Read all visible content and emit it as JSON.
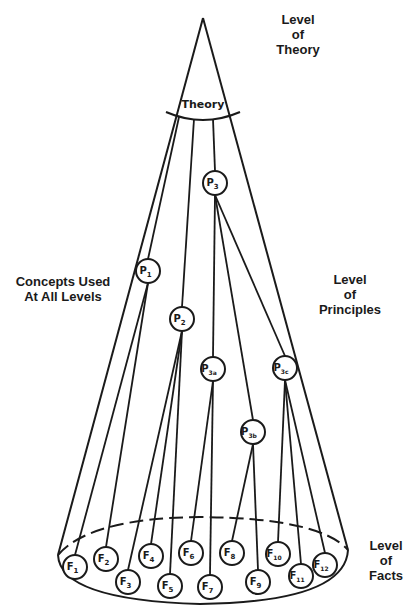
{
  "labels": {
    "theory_level": [
      "Level",
      "of",
      "Theory"
    ],
    "concepts": [
      "Concepts Used",
      "At All Levels"
    ],
    "principles_level": [
      "Level",
      "of",
      "Principles"
    ],
    "facts_level": [
      "Level",
      "of",
      "Facts"
    ]
  },
  "theory_node": {
    "label": "Theory"
  },
  "principles": [
    {
      "id": "P1",
      "main": "P",
      "sub": "1",
      "x": 148,
      "y": 271
    },
    {
      "id": "P2",
      "main": "P",
      "sub": "2",
      "x": 182,
      "y": 319
    },
    {
      "id": "P3",
      "main": "P",
      "sub": "3",
      "x": 215,
      "y": 183
    },
    {
      "id": "P3a",
      "main": "P",
      "sub": "3a",
      "x": 213,
      "y": 369
    },
    {
      "id": "P3b",
      "main": "P",
      "sub": "3b",
      "x": 253,
      "y": 432
    },
    {
      "id": "P3c",
      "main": "P",
      "sub": "3c",
      "x": 285,
      "y": 368
    }
  ],
  "facts": [
    {
      "id": "F1",
      "main": "F",
      "sub": "1",
      "x": 75,
      "y": 567
    },
    {
      "id": "F2",
      "main": "F",
      "sub": "2",
      "x": 106,
      "y": 559
    },
    {
      "id": "F3",
      "main": "F",
      "sub": "3",
      "x": 128,
      "y": 582
    },
    {
      "id": "F4",
      "main": "F",
      "sub": "4",
      "x": 151,
      "y": 556
    },
    {
      "id": "F5",
      "main": "F",
      "sub": "5",
      "x": 170,
      "y": 586
    },
    {
      "id": "F6",
      "main": "F",
      "sub": "6",
      "x": 191,
      "y": 553
    },
    {
      "id": "F7",
      "main": "F",
      "sub": "7",
      "x": 210,
      "y": 587
    },
    {
      "id": "F8",
      "main": "F",
      "sub": "8",
      "x": 232,
      "y": 553
    },
    {
      "id": "F9",
      "main": "F",
      "sub": "9",
      "x": 258,
      "y": 582
    },
    {
      "id": "F10",
      "main": "F",
      "sub": "10",
      "x": 278,
      "y": 554
    },
    {
      "id": "F11",
      "main": "F",
      "sub": "11",
      "x": 301,
      "y": 576
    },
    {
      "id": "F12",
      "main": "F",
      "sub": "12",
      "x": 325,
      "y": 565
    }
  ],
  "edges": [
    [
      "Theory",
      "P1"
    ],
    [
      "Theory",
      "P2"
    ],
    [
      "Theory",
      "P3"
    ],
    [
      "P1",
      "F1"
    ],
    [
      "P1",
      "F2"
    ],
    [
      "P2",
      "F3"
    ],
    [
      "P2",
      "F4"
    ],
    [
      "P2",
      "F5"
    ],
    [
      "P3",
      "P3a"
    ],
    [
      "P3",
      "P3b"
    ],
    [
      "P3",
      "P3c"
    ],
    [
      "P3a",
      "F6"
    ],
    [
      "P3a",
      "F7"
    ],
    [
      "P3b",
      "F8"
    ],
    [
      "P3b",
      "F9"
    ],
    [
      "P3c",
      "F10"
    ],
    [
      "P3c",
      "F11"
    ],
    [
      "P3c",
      "F12"
    ]
  ],
  "colors": {
    "ink": "#1a1a1a",
    "background": "#ffffff"
  }
}
